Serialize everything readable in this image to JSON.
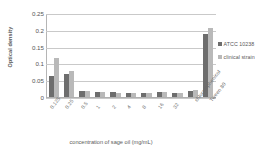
{
  "chart_data": {
    "type": "bar",
    "title": "",
    "xlabel": "concentration of sage oil (mg/mL)",
    "ylabel": "Optical density",
    "ylim": [
      0,
      0.25
    ],
    "yticks": [
      0,
      0.05,
      0.1,
      0.15,
      0.2,
      0.25
    ],
    "ytick_labels": [
      "0",
      "0.05",
      "0.1",
      "0.15",
      "0.2",
      "0.25"
    ],
    "grid": true,
    "legend_position": "right",
    "categories": [
      "0.125",
      "0.25",
      "0.5",
      "1",
      "2",
      "4",
      "8",
      "16",
      "32",
      "chloramphenicol",
      "Tween 80"
    ],
    "series": [
      {
        "name": "ATCC 10238",
        "color": "#6d6d6d",
        "values": [
          0.064,
          0.07,
          0.018,
          0.014,
          0.016,
          0.013,
          0.012,
          0.015,
          0.013,
          0.018,
          0.189
        ]
      },
      {
        "name": "clinical strain",
        "color": "#b9b9b9",
        "values": [
          0.117,
          0.079,
          0.019,
          0.016,
          0.012,
          0.013,
          0.012,
          0.016,
          0.013,
          0.02,
          0.208
        ]
      }
    ]
  },
  "legend": {
    "entries": [
      {
        "label": "ATCC 10238"
      },
      {
        "label": "clinical strain"
      }
    ]
  }
}
